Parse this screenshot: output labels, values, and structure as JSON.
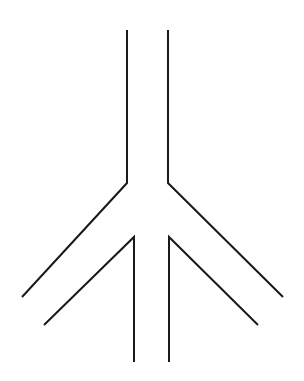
{
  "canvas": {
    "width": 304,
    "height": 381,
    "background_color": "#ffffff"
  },
  "figure": {
    "stroke_color": "#1a1a1a",
    "stroke_width": 2,
    "symmetry_axis_x": 148,
    "strokes": [
      {
        "name": "left-outer-branch",
        "kind": "polyline",
        "points": [
          [
            127,
            30
          ],
          [
            127,
            183
          ],
          [
            22,
            297
          ]
        ]
      },
      {
        "name": "right-outer-branch",
        "kind": "polyline",
        "points": [
          [
            168,
            30
          ],
          [
            168,
            183
          ],
          [
            283,
            297
          ]
        ]
      },
      {
        "name": "left-inner-branch",
        "kind": "polyline",
        "points": [
          [
            44,
            325
          ],
          [
            134,
            237
          ],
          [
            134,
            362
          ]
        ]
      },
      {
        "name": "right-inner-branch",
        "kind": "polyline",
        "points": [
          [
            258,
            325
          ],
          [
            169,
            237
          ],
          [
            169,
            362
          ]
        ]
      }
    ],
    "vertices": [
      {
        "name": "left-top-endpoint",
        "x": 127,
        "y": 30
      },
      {
        "name": "right-top-endpoint",
        "x": 168,
        "y": 30
      },
      {
        "name": "left-outer-bend",
        "x": 127,
        "y": 183
      },
      {
        "name": "right-outer-bend",
        "x": 168,
        "y": 183
      },
      {
        "name": "left-outer-endpoint",
        "x": 22,
        "y": 297
      },
      {
        "name": "right-outer-endpoint",
        "x": 283,
        "y": 297
      },
      {
        "name": "left-inner-apex",
        "x": 134,
        "y": 237
      },
      {
        "name": "right-inner-apex",
        "x": 169,
        "y": 237
      },
      {
        "name": "left-inner-endpoint",
        "x": 44,
        "y": 325
      },
      {
        "name": "right-inner-endpoint",
        "x": 258,
        "y": 325
      },
      {
        "name": "left-bottom-endpoint",
        "x": 134,
        "y": 362
      },
      {
        "name": "right-bottom-endpoint",
        "x": 169,
        "y": 362
      }
    ]
  }
}
